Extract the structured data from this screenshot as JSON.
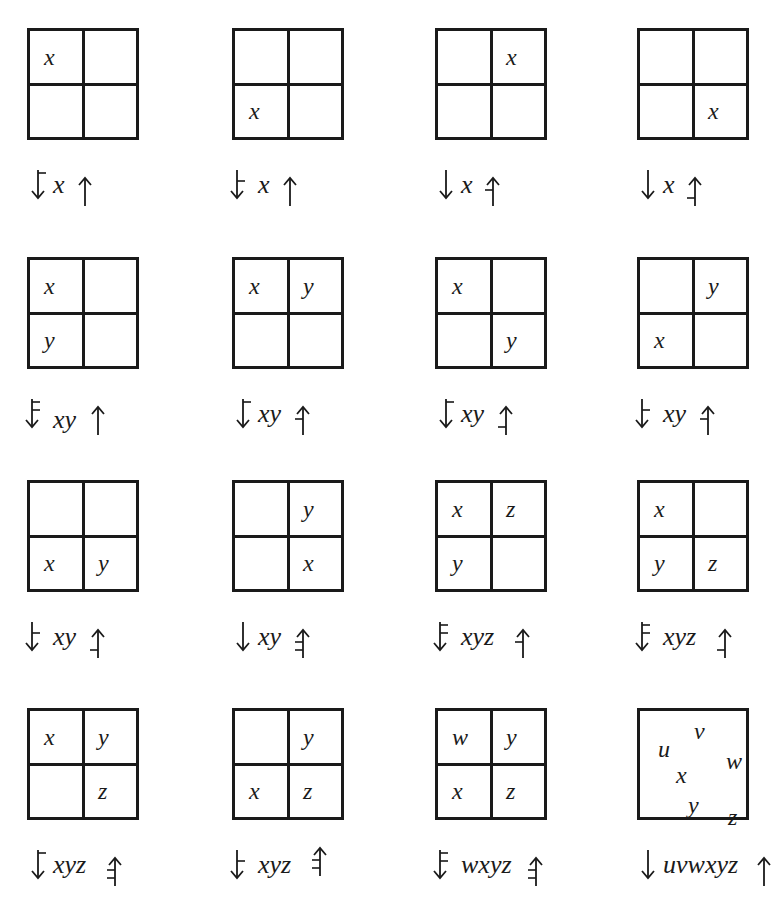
{
  "diagram": {
    "colors": {
      "ink": "#1a1a1a",
      "background": "#ffffff"
    },
    "panels": [
      {
        "id": 1,
        "cells": [
          "x",
          "",
          "",
          ""
        ],
        "label": "xy",
        "text": "x",
        "down_ticks": [
          "top"
        ],
        "up_ticks": []
      },
      {
        "id": 2,
        "cells": [
          "",
          "",
          "x",
          ""
        ],
        "text": "x",
        "down_ticks": [
          "mid"
        ],
        "up_ticks": []
      },
      {
        "id": 3,
        "cells": [
          "",
          "x",
          "",
          ""
        ],
        "text": "x",
        "down_ticks": [],
        "up_ticks": [
          "mid"
        ]
      },
      {
        "id": 4,
        "cells": [
          "",
          "",
          "",
          "x"
        ],
        "text": "x",
        "down_ticks": [],
        "up_ticks": [
          "low"
        ]
      },
      {
        "id": 5,
        "cells": [
          "x",
          "",
          "y",
          ""
        ],
        "text": "xy",
        "down_ticks": [
          "top",
          "mid"
        ],
        "up_ticks": []
      },
      {
        "id": 6,
        "cells": [
          "x",
          "y",
          "",
          ""
        ],
        "text": "xy",
        "down_ticks": [
          "top"
        ],
        "up_ticks": [
          "mid"
        ]
      },
      {
        "id": 7,
        "cells": [
          "x",
          "",
          "",
          "y"
        ],
        "text": "xy",
        "down_ticks": [
          "top"
        ],
        "up_ticks": [
          "low"
        ]
      },
      {
        "id": 8,
        "cells": [
          "",
          "y",
          "x",
          ""
        ],
        "text": "xy",
        "down_ticks": [
          "mid"
        ],
        "up_ticks": [
          "mid"
        ]
      },
      {
        "id": 9,
        "cells": [
          "",
          "",
          "x",
          "y"
        ],
        "text": "xy",
        "down_ticks": [
          "mid"
        ],
        "up_ticks": [
          "low"
        ]
      },
      {
        "id": 10,
        "cells": [
          "",
          "y",
          "",
          "x"
        ],
        "text": "xy",
        "down_ticks": [],
        "up_ticks": [
          "mid",
          "low"
        ]
      },
      {
        "id": 11,
        "cells": [
          "x",
          "z",
          "y",
          ""
        ],
        "text": "xyz",
        "down_ticks": [
          "top",
          "mid"
        ],
        "up_ticks": [
          "mid"
        ]
      },
      {
        "id": 12,
        "cells": [
          "x",
          "",
          "y",
          "z"
        ],
        "text": "xyz",
        "down_ticks": [
          "top",
          "mid"
        ],
        "up_ticks": [
          "low"
        ]
      },
      {
        "id": 13,
        "cells": [
          "x",
          "y",
          "",
          "z"
        ],
        "text": "xyz",
        "down_ticks": [
          "top"
        ],
        "up_ticks": [
          "mid",
          "low"
        ]
      },
      {
        "id": 14,
        "cells": [
          "",
          "y",
          "x",
          "z"
        ],
        "text": "xyz",
        "down_ticks": [
          "mid"
        ],
        "up_ticks": [
          "mid",
          "low"
        ]
      },
      {
        "id": 15,
        "cells": [
          "w",
          "y",
          "x",
          "z"
        ],
        "text": "wxyz",
        "down_ticks": [
          "top",
          "mid"
        ],
        "up_ticks": [
          "mid",
          "low"
        ]
      },
      {
        "id": 16,
        "cells": [],
        "scattered": [
          "u",
          "v",
          "w",
          "x",
          "y",
          "z"
        ],
        "text": "uvwxyz",
        "down_ticks": [],
        "up_ticks": []
      }
    ]
  }
}
